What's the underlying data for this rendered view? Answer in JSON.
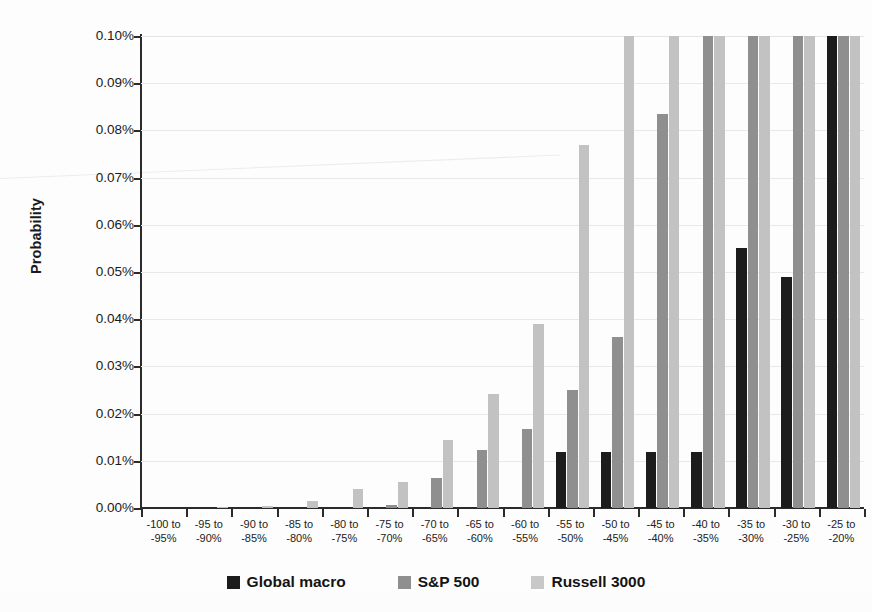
{
  "chart_data": {
    "type": "bar",
    "title": "",
    "xlabel": "",
    "ylabel": "Probability",
    "ylim": [
      0,
      0.1
    ],
    "ytick_labels": [
      "0.10%",
      "0.09%",
      "0.08%",
      "0.07%",
      "0.06%",
      "0.05%",
      "0.04%",
      "0.03%",
      "0.02%",
      "0.01%",
      "0.00%"
    ],
    "ytick_values": [
      0.1,
      0.09,
      0.08,
      0.07,
      0.06,
      0.05,
      0.04,
      0.03,
      0.02,
      0.01,
      0.0
    ],
    "grid": true,
    "legend_position": "bottom",
    "value_unit": "%",
    "note": "Bars exceeding 0.10% are clipped at the top of the axis",
    "categories": [
      "-100 to -95%",
      "-95 to -90%",
      "-90 to -85%",
      "-85 to -80%",
      "-80 to -75%",
      "-75 to -70%",
      "-70 to -65%",
      "-65 to -60%",
      "-60 to -55%",
      "-55 to -50%",
      "-50 to -45%",
      "-45 to -40%",
      "-40 to -35%",
      "-35 to -30%",
      "-30 to -25%",
      "-25 to -20%"
    ],
    "category_lines": [
      [
        "-100 to",
        "-95%"
      ],
      [
        "-95 to",
        "-90%"
      ],
      [
        "-90 to",
        "-85%"
      ],
      [
        "-85 to",
        "-80%"
      ],
      [
        "-80 to",
        "-75%"
      ],
      [
        "-75 to",
        "-70%"
      ],
      [
        "-70 to",
        "-65%"
      ],
      [
        "-65 to",
        "-60%"
      ],
      [
        "-60 to",
        "-55%"
      ],
      [
        "-55 to",
        "-50%"
      ],
      [
        "-50 to",
        "-45%"
      ],
      [
        "-45 to",
        "-40%"
      ],
      [
        "-40 to",
        "-35%"
      ],
      [
        "-35 to",
        "-30%"
      ],
      [
        "-30 to",
        "-25%"
      ],
      [
        "-25 to",
        "-20%"
      ]
    ],
    "series": [
      {
        "name": "Global macro",
        "color": "#1c1c1c",
        "values": [
          0.0,
          0.0,
          0.0,
          0.0,
          0.0,
          0.0,
          0.0,
          0.0,
          0.0,
          0.0118,
          0.0118,
          0.0118,
          0.0118,
          0.055,
          0.049,
          0.1
        ]
      },
      {
        "name": "S&P 500",
        "color": "#8f8f8f",
        "values": [
          0.0,
          0.0,
          0.0,
          0.0,
          0.0,
          0.0007,
          0.0063,
          0.0122,
          0.0167,
          0.025,
          0.0363,
          0.0835,
          0.1,
          0.1,
          0.1,
          0.1
        ]
      },
      {
        "name": "Russell 3000",
        "color": "#c2c2c2",
        "values": [
          0.0,
          0.0002,
          0.0005,
          0.0014,
          0.004,
          0.0055,
          0.0145,
          0.0242,
          0.039,
          0.077,
          0.1,
          0.1,
          0.1,
          0.1,
          0.1,
          0.1
        ]
      }
    ]
  },
  "legend": {
    "items": [
      {
        "label": "Global macro",
        "key": "s-global"
      },
      {
        "label": "S&P 500",
        "key": "s-sp500"
      },
      {
        "label": "Russell 3000",
        "key": "s-russell"
      }
    ]
  }
}
